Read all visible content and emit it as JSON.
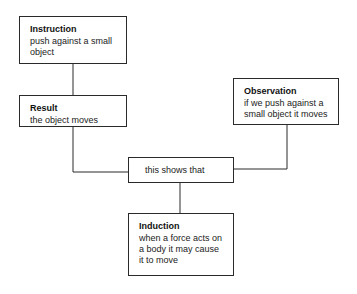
{
  "diagram": {
    "type": "flowchart",
    "nodes": [
      {
        "id": "instruction",
        "title": "Instruction",
        "body": "push against a small object"
      },
      {
        "id": "result",
        "title": "Result",
        "body": "the object moves"
      },
      {
        "id": "observation",
        "title": "Observation",
        "body": "if we push against a small object it moves"
      },
      {
        "id": "shows",
        "title": "",
        "body": "this shows that"
      },
      {
        "id": "induction",
        "title": "Induction",
        "body": "when a force acts on a body it may cause it to move"
      }
    ],
    "edges": [
      {
        "from": "instruction",
        "to": "result"
      },
      {
        "from": "result",
        "to": "shows"
      },
      {
        "from": "observation",
        "to": "shows"
      },
      {
        "from": "shows",
        "to": "induction"
      }
    ],
    "colors": {
      "line": "#2a2a2a",
      "background": "#ffffff",
      "text": "#1a1a1a"
    }
  }
}
